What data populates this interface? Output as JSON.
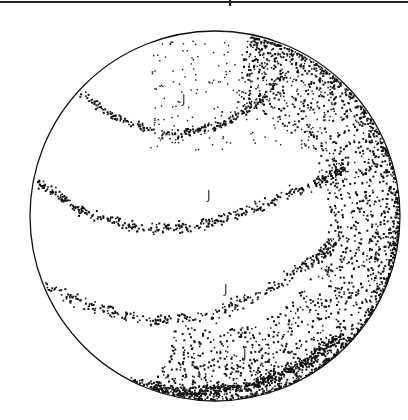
{
  "figure": {
    "type": "stereonet",
    "top_rule": {
      "y": 3,
      "tick_x": 229
    },
    "circle": {
      "cx": 215,
      "cy": 216,
      "r": 185,
      "stroke": "#111111"
    },
    "dot_color": "#111111",
    "labels": [
      {
        "text": "J",
        "x": 182,
        "y": 92
      },
      {
        "text": "J",
        "x": 207,
        "y": 188
      },
      {
        "text": "J",
        "x": 224,
        "y": 282
      },
      {
        "text": "J",
        "x": 243,
        "y": 347
      }
    ],
    "bands": [
      {
        "name": "band-1",
        "pts": [
          [
            80,
            92
          ],
          [
            120,
            120
          ],
          [
            170,
            135
          ],
          [
            220,
            125
          ],
          [
            260,
            100
          ],
          [
            285,
            70
          ]
        ],
        "spread": 6,
        "n": 260
      },
      {
        "name": "band-2",
        "pts": [
          [
            36,
            180
          ],
          [
            80,
            210
          ],
          [
            140,
            228
          ],
          [
            200,
            225
          ],
          [
            260,
            205
          ],
          [
            320,
            180
          ],
          [
            345,
            165
          ]
        ],
        "spread": 8,
        "n": 420
      },
      {
        "name": "band-3",
        "pts": [
          [
            40,
            285
          ],
          [
            90,
            305
          ],
          [
            150,
            320
          ],
          [
            210,
            315
          ],
          [
            260,
            295
          ],
          [
            310,
            260
          ],
          [
            340,
            240
          ]
        ],
        "spread": 9,
        "n": 320
      },
      {
        "name": "band-4",
        "pts": [
          [
            130,
            382
          ],
          [
            190,
            392
          ],
          [
            250,
            385
          ],
          [
            300,
            365
          ],
          [
            340,
            335
          ]
        ],
        "spread": 8,
        "n": 500
      }
    ],
    "rim_density": {
      "start_deg": -80,
      "end_deg": 110,
      "n": 2200,
      "width": 70
    },
    "scatter_top": {
      "n": 220
    }
  }
}
